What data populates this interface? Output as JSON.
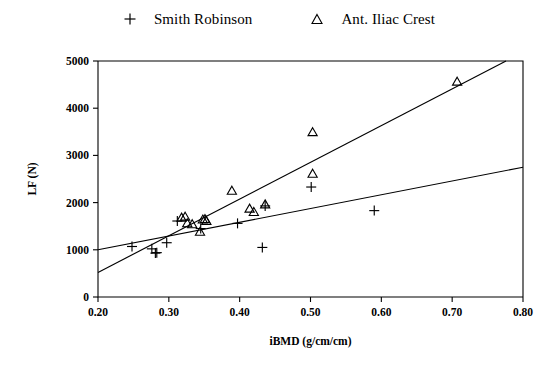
{
  "legend": {
    "position": "top-center",
    "entries": [
      {
        "marker": "plus-marker-icon",
        "label": "Smith Robinson"
      },
      {
        "marker": "triangle-marker-icon",
        "label": "Ant. Iliac Crest"
      }
    ]
  },
  "chart_data": {
    "type": "scatter",
    "title": "",
    "xlabel": "iBMD (g/cm/cm)",
    "ylabel": "LF (N)",
    "xlim": [
      0.2,
      0.8
    ],
    "ylim": [
      0,
      5000
    ],
    "xticks": [
      "0.20",
      "0.30",
      "0.40",
      "0.50",
      "0.60",
      "0.70",
      "0.80"
    ],
    "xtick_values": [
      0.2,
      0.3,
      0.4,
      0.5,
      0.6,
      0.7,
      0.8
    ],
    "yticks": [
      "0",
      "1000",
      "2000",
      "3000",
      "4000",
      "5000"
    ],
    "ytick_values": [
      0,
      1000,
      2000,
      3000,
      4000,
      5000
    ],
    "grid": false,
    "series": [
      {
        "name": "Smith Robinson",
        "marker": "plus",
        "points": [
          [
            0.248,
            1070
          ],
          [
            0.276,
            1020
          ],
          [
            0.281,
            930
          ],
          [
            0.283,
            940
          ],
          [
            0.297,
            1150
          ],
          [
            0.312,
            1610
          ],
          [
            0.345,
            1450
          ],
          [
            0.397,
            1560
          ],
          [
            0.432,
            1050
          ],
          [
            0.436,
            1930
          ],
          [
            0.501,
            2330
          ],
          [
            0.59,
            1830
          ]
        ]
      },
      {
        "name": "Ant. Iliac Crest",
        "marker": "triangle",
        "points": [
          [
            0.318,
            1680
          ],
          [
            0.323,
            1700
          ],
          [
            0.326,
            1560
          ],
          [
            0.333,
            1540
          ],
          [
            0.344,
            1380
          ],
          [
            0.348,
            1640
          ],
          [
            0.351,
            1650
          ],
          [
            0.353,
            1610
          ],
          [
            0.389,
            2250
          ],
          [
            0.414,
            1870
          ],
          [
            0.42,
            1800
          ],
          [
            0.436,
            1960
          ],
          [
            0.503,
            3490
          ],
          [
            0.503,
            2610
          ],
          [
            0.707,
            4560
          ]
        ]
      }
    ],
    "fit_lines": [
      {
        "name": "Ant. Iliac Crest regression",
        "x_start": 0.2,
        "y_start": 520,
        "x_end": 0.776,
        "y_end": 5000
      },
      {
        "name": "Smith Robinson regression",
        "x_start": 0.2,
        "y_start": 1000,
        "x_end": 0.8,
        "y_end": 2750
      }
    ]
  }
}
